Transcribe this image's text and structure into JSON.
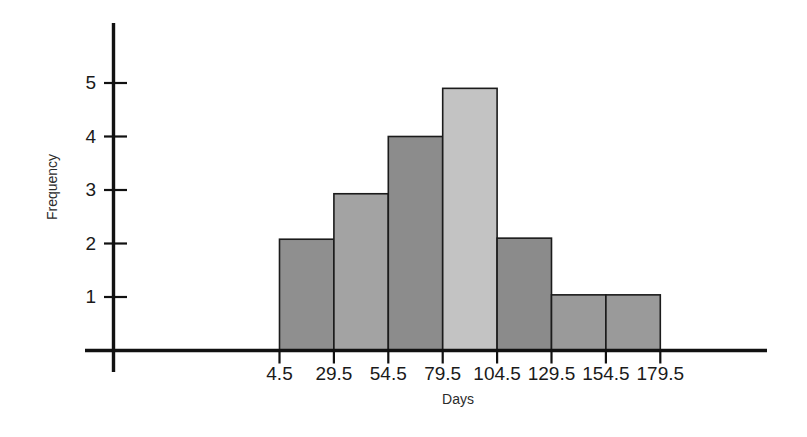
{
  "chart_data": {
    "type": "bar",
    "title": "",
    "subtitle": "",
    "xlabel": "Days",
    "ylabel": "Frequency",
    "categories": [
      "4.5-29.5",
      "29.5-54.5",
      "54.5-79.5",
      "79.5-104.5",
      "104.5-129.5",
      "129.5-154.5",
      "154.5-179.5"
    ],
    "bin_edges": [
      4.5,
      29.5,
      54.5,
      79.5,
      104.5,
      129.5,
      154.5,
      179.5
    ],
    "values": [
      2.08,
      2.93,
      4.0,
      4.9,
      2.1,
      1.04,
      1.04
    ],
    "xtick_labels": [
      "4.5",
      "29.5",
      "54.5",
      "79.5",
      "104.5",
      "129.5",
      "154.5",
      "179.5"
    ],
    "ytick_labels": [
      "1",
      "2",
      "3",
      "4",
      "5"
    ],
    "ytick_values": [
      1,
      2,
      3,
      4,
      5
    ],
    "xlim": [
      4.5,
      179.5
    ],
    "ylim": [
      0,
      5.6
    ],
    "grid": false,
    "legend": null,
    "bar_colors": [
      "#8f8f8f",
      "#a3a3a3",
      "#8c8c8c",
      "#c3c3c3",
      "#8b8b8b",
      "#9a9a9a",
      "#9a9a9a"
    ],
    "bar_edge_color": "#1b1b1b",
    "axis_color": "#111111",
    "background_color": "#ffffff"
  },
  "axes": {
    "y_title": "Frequency",
    "x_title": "Days"
  }
}
